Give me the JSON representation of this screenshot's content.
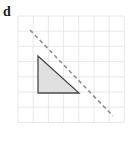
{
  "figure": {
    "panel_label": "d",
    "background_color": "#ffffff"
  },
  "grid": {
    "line_color": "#e2e2e6",
    "line_width": 0.8,
    "origin_x": 18,
    "origin_y": 16,
    "cell_size": 15.2,
    "columns": 7,
    "rows": 7,
    "x_lines": [
      18,
      33.2,
      48.4,
      63.6,
      78.8,
      94,
      109.2,
      124.4
    ],
    "y_lines": [
      16,
      31.2,
      46.4,
      61.6,
      76.8,
      92,
      107.2,
      122.4
    ]
  },
  "shape": {
    "name": "shaded-triangle",
    "fill_color": "#e0e0e0",
    "stroke_color": "#4a4a4a",
    "stroke_width": 1.3,
    "vertices": [
      {
        "x": 38,
        "y": 56
      },
      {
        "x": 79,
        "y": 93
      },
      {
        "x": 38,
        "y": 93
      }
    ],
    "points_attr": "38,56 79,93 38,93"
  },
  "dashed_line": {
    "name": "mirror-line",
    "stroke_color": "#8a8a8a",
    "stroke_width": 1.5,
    "dash_pattern": "4 3",
    "x1": 30,
    "y1": 30,
    "x2": 113,
    "y2": 116
  },
  "chart_data": {
    "type": "scatter",
    "title": "d",
    "xlabel": "",
    "ylabel": "",
    "xlim": [
      0,
      7
    ],
    "ylim": [
      0,
      7
    ],
    "grid": true,
    "legend": "none",
    "annotations": [
      {
        "label": "shaded triangle",
        "kind": "polygon",
        "grid_points": [
          [
            1.32,
            2.63
          ],
          [
            4.01,
            5.07
          ],
          [
            1.32,
            5.07
          ]
        ]
      },
      {
        "label": "dashed diagonal line",
        "kind": "line",
        "grid_points": [
          [
            0.79,
            0.92
          ],
          [
            6.25,
            6.58
          ]
        ]
      }
    ]
  }
}
